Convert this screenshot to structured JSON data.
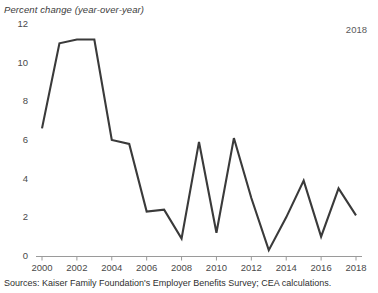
{
  "chart_data": {
    "type": "line",
    "title": "Percent change (year-over-year)",
    "xlabel": "",
    "ylabel": "",
    "ylim": [
      0,
      12
    ],
    "xlim": [
      2000,
      2018
    ],
    "grid": false,
    "legend": null,
    "annotations": [
      {
        "name": "latest-year",
        "text": "2018"
      }
    ],
    "ytick_labels": [
      "12",
      "10",
      "8",
      "6",
      "4",
      "2",
      "0"
    ],
    "ytick_values": [
      12,
      10,
      8,
      6,
      4,
      2,
      0
    ],
    "xtick_labels": [
      "2000",
      "2002",
      "2004",
      "2006",
      "2008",
      "2010",
      "2012",
      "2014",
      "2016",
      "2018"
    ],
    "xtick_values": [
      2000,
      2002,
      2004,
      2006,
      2008,
      2010,
      2012,
      2014,
      2016,
      2018
    ],
    "x": [
      2000,
      2001,
      2002,
      2003,
      2004,
      2005,
      2006,
      2007,
      2008,
      2009,
      2010,
      2011,
      2012,
      2013,
      2014,
      2015,
      2016,
      2017,
      2018
    ],
    "values": [
      6.6,
      11.0,
      11.2,
      11.2,
      6.0,
      5.8,
      2.3,
      2.4,
      0.9,
      5.9,
      1.2,
      6.1,
      3.0,
      0.3,
      2.0,
      3.9,
      1.0,
      3.5,
      2.1
    ],
    "series": [
      {
        "name": "Percent change (year-over-year)",
        "color": "#3a3a3a",
        "values": [
          6.6,
          11.0,
          11.2,
          11.2,
          6.0,
          5.8,
          2.3,
          2.4,
          0.9,
          5.9,
          1.2,
          6.1,
          3.0,
          0.3,
          2.0,
          3.9,
          1.0,
          3.5,
          2.1
        ]
      }
    ],
    "source": "Sources: Kaiser Family Foundation's Employer Benefits Survey; CEA calculations."
  },
  "colors": {
    "line": "#3a3a3a",
    "axis": "#9a9a9a",
    "tick_text": "#4a4a4a",
    "title_text": "#3c3c3c",
    "background": "#ffffff"
  }
}
